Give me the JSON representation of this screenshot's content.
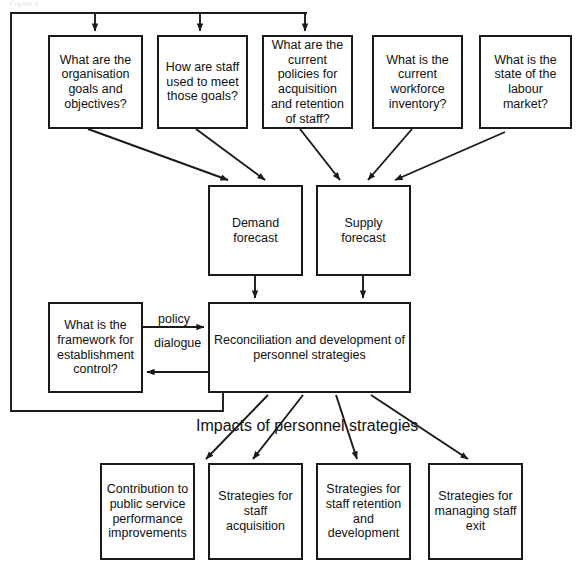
{
  "diagram": {
    "title_text": "Impacts of personnel strategies",
    "top_cut_off_text": "Figure 1",
    "colors": {
      "stroke": "#1a1a1a",
      "fill": "#ffffff",
      "text": "#111111"
    },
    "question_boxes": [
      {
        "id": "q-organisation-goals",
        "label": "What are the organisation goals and objectives?"
      },
      {
        "id": "q-staff-used",
        "label": "How are staff used to meet those goals?"
      },
      {
        "id": "q-current-policies",
        "label": "What are the current policies for acquisition and retention of staff?"
      },
      {
        "id": "q-workforce-inventory",
        "label": "What is the current workforce inventory?"
      },
      {
        "id": "q-labour-market",
        "label": "What is the state of the labour market?"
      }
    ],
    "forecast_boxes": [
      {
        "id": "demand-forecast",
        "label": "Demand forecast"
      },
      {
        "id": "supply-forecast",
        "label": "Supply forecast"
      }
    ],
    "framework_box": {
      "id": "framework-establishment-control",
      "label": "What is the framework for establishment control?"
    },
    "reconciliation_box": {
      "id": "reconciliation-development",
      "label": "Reconciliation and development of personnel strategies"
    },
    "edge_labels": [
      {
        "id": "policy-label",
        "label": "policy"
      },
      {
        "id": "dialogue-label",
        "label": "dialogue"
      }
    ],
    "outcome_boxes": [
      {
        "id": "outcome-contribution",
        "label": "Contribution to public service performance improvements"
      },
      {
        "id": "outcome-acquisition",
        "label": "Strategies for staff acquisition"
      },
      {
        "id": "outcome-retention",
        "label": "Strategies for staff retention and development"
      },
      {
        "id": "outcome-exit",
        "label": "Strategies for managing staff exit"
      }
    ]
  }
}
